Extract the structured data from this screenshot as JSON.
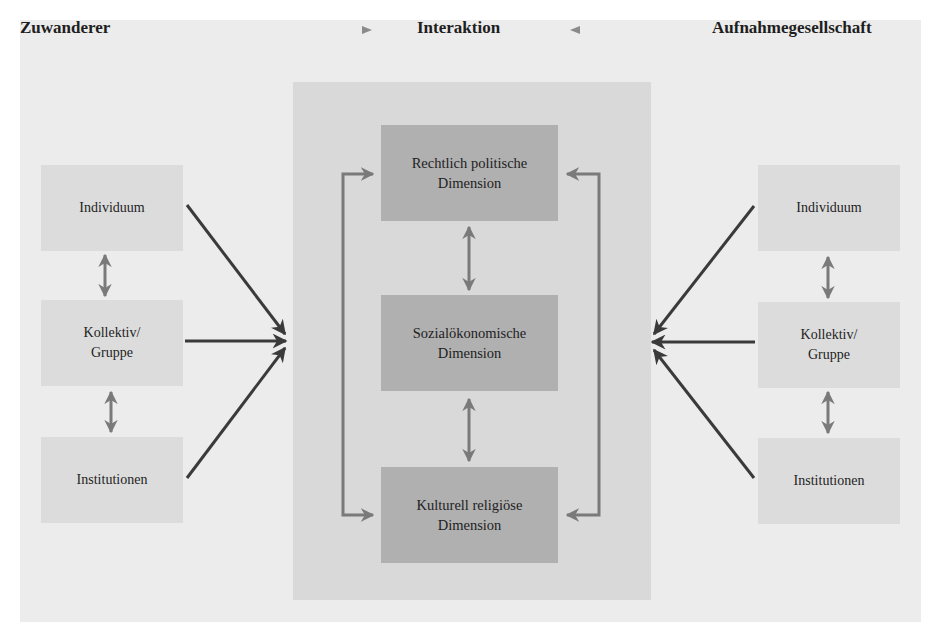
{
  "diagram": {
    "headings": {
      "left": "Zuwanderer",
      "center": "Interaktion",
      "right": "Aufnahmegesellschaft"
    },
    "left_column": [
      {
        "label": "Individuum"
      },
      {
        "label": "Kollektiv/\nGruppe"
      },
      {
        "label": "Institutionen"
      }
    ],
    "right_column": [
      {
        "label": "Individuum"
      },
      {
        "label": "Kollektiv/\nGruppe"
      },
      {
        "label": "Institutionen"
      }
    ],
    "dimensions": [
      {
        "label": "Rechtlich politische\nDimension"
      },
      {
        "label": "Sozialökonomische\nDimension"
      },
      {
        "label": "Kulturell religiöse\nDimension"
      }
    ],
    "colors": {
      "frame": "#ececec",
      "center_panel": "#d9d9d9",
      "side_box": "#dcdcdc",
      "dimension_box": "#b0b0b0",
      "dark_arrow": "#3a3a3a",
      "light_arrow": "#7a7a7a"
    }
  }
}
